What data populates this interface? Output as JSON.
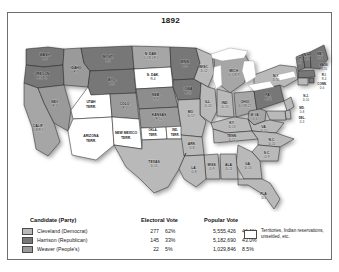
{
  "map": {
    "title": "1892",
    "colors": {
      "democrat": "#b9b9b9",
      "republican": "#777777",
      "peoples": "#9a9a9a",
      "territory": "#ffffff",
      "water": "#d8d8d8",
      "border": "#2b2b2b"
    },
    "states": [
      {
        "name": "WASH.",
        "votes": "R-4",
        "party": "republican"
      },
      {
        "name": "OREGON",
        "votes": "R-3/P-1",
        "party": "republican"
      },
      {
        "name": "IDAHO",
        "votes": "P-3",
        "party": "peoples"
      },
      {
        "name": "MONT.",
        "votes": "R-3",
        "party": "republican"
      },
      {
        "name": "N. DAK.",
        "votes": "D-1/R-1/P-1",
        "party": "split"
      },
      {
        "name": "S. DAK.",
        "votes": "R-4",
        "party": "republican"
      },
      {
        "name": "MINN.",
        "votes": "R-9",
        "party": "republican"
      },
      {
        "name": "WIS.",
        "votes": "D-12",
        "party": "democrat"
      },
      {
        "name": "MICH.",
        "votes": "D-5/R-9",
        "party": "split"
      },
      {
        "name": "WYO.",
        "votes": "R-3",
        "party": "republican"
      },
      {
        "name": "NEB.",
        "votes": "R-8",
        "party": "republican"
      },
      {
        "name": "IOWA",
        "votes": "R-13",
        "party": "republican"
      },
      {
        "name": "ILL.",
        "votes": "D-24",
        "party": "democrat"
      },
      {
        "name": "IND.",
        "votes": "D-15",
        "party": "democrat"
      },
      {
        "name": "OHIO",
        "votes": "D-1/R-22",
        "party": "split"
      },
      {
        "name": "NEV.",
        "votes": "P-3",
        "party": "peoples"
      },
      {
        "name": "UTAH TERR.",
        "votes": "",
        "party": "territory"
      },
      {
        "name": "COLO.",
        "votes": "P-4",
        "party": "peoples"
      },
      {
        "name": "KANSAS",
        "votes": "P-10",
        "party": "peoples"
      },
      {
        "name": "MO.",
        "votes": "D-17",
        "party": "democrat"
      },
      {
        "name": "KY.",
        "votes": "D-13",
        "party": "democrat"
      },
      {
        "name": "W. VA.",
        "votes": "D-6",
        "party": "democrat"
      },
      {
        "name": "VA.",
        "votes": "D-12",
        "party": "democrat"
      },
      {
        "name": "MD.",
        "votes": "D-8",
        "party": "democrat"
      },
      {
        "name": "DEL.",
        "votes": "D-3",
        "party": "democrat"
      },
      {
        "name": "N.J.",
        "votes": "D-10",
        "party": "democrat"
      },
      {
        "name": "PA.",
        "votes": "R-32",
        "party": "republican"
      },
      {
        "name": "N.Y.",
        "votes": "D-36",
        "party": "democrat"
      },
      {
        "name": "CONN.",
        "votes": "D-6",
        "party": "democrat"
      },
      {
        "name": "R.I.",
        "votes": "R-4",
        "party": "republican"
      },
      {
        "name": "MASS.",
        "votes": "R-15",
        "party": "republican"
      },
      {
        "name": "VT.",
        "votes": "R-4",
        "party": "republican"
      },
      {
        "name": "N.H.",
        "votes": "R-4",
        "party": "republican"
      },
      {
        "name": "ME.",
        "votes": "R-6",
        "party": "republican"
      },
      {
        "name": "CALIF.",
        "votes": "D-8/R-1",
        "party": "split"
      },
      {
        "name": "ARIZONA TERR.",
        "votes": "",
        "party": "territory"
      },
      {
        "name": "NEW MEXICO TERR.",
        "votes": "",
        "party": "territory"
      },
      {
        "name": "OKLA. TERR.",
        "votes": "",
        "party": "territory"
      },
      {
        "name": "IND. TERR.",
        "votes": "",
        "party": "territory"
      },
      {
        "name": "TEXAS",
        "votes": "D-15",
        "party": "democrat"
      },
      {
        "name": "ARK.",
        "votes": "D-8",
        "party": "democrat"
      },
      {
        "name": "LA.",
        "votes": "D-8",
        "party": "democrat"
      },
      {
        "name": "MISS.",
        "votes": "D-9",
        "party": "democrat"
      },
      {
        "name": "ALA.",
        "votes": "D-11",
        "party": "democrat"
      },
      {
        "name": "TENN.",
        "votes": "D-12",
        "party": "democrat"
      },
      {
        "name": "GA.",
        "votes": "D-13",
        "party": "democrat"
      },
      {
        "name": "S.C.",
        "votes": "D-9",
        "party": "democrat"
      },
      {
        "name": "N.C.",
        "votes": "D-11",
        "party": "democrat"
      },
      {
        "name": "FLA.",
        "votes": "D-4",
        "party": "democrat"
      }
    ]
  },
  "legend": {
    "headers": {
      "candidate": "Candidate (Party)",
      "electoral": "Electoral Vote",
      "popular": "Popular Vote"
    },
    "rows": [
      {
        "candidate": "Cleveland (Democrat)",
        "swatch": "#b9b9b9",
        "electoral_votes": "277",
        "electoral_pct": "62%",
        "popular_votes": "5,555,426",
        "popular_pct": "46.1%"
      },
      {
        "candidate": "Harrison (Republican)",
        "swatch": "#777777",
        "electoral_votes": "145",
        "electoral_pct": "33%",
        "popular_votes": "5,182,690",
        "popular_pct": "43.0%"
      },
      {
        "candidate": "Weaver (People's)",
        "swatch": "#9a9a9a",
        "electoral_votes": "22",
        "electoral_pct": "5%",
        "popular_votes": "1,029,846",
        "popular_pct": "8.5%"
      }
    ],
    "territory_key": "Territories, Indian reservations, unsettled, etc."
  }
}
